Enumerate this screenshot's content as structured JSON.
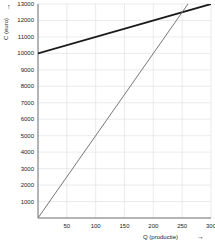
{
  "chart_data": {
    "type": "line",
    "title": "",
    "xlabel": "Q (productie)",
    "ylabel": "C (euro)",
    "xlim": [
      0,
      300
    ],
    "ylim": [
      0,
      13000
    ],
    "grid": true,
    "legend": "none",
    "x_ticks": [
      50,
      100,
      150,
      200,
      250,
      300
    ],
    "y_ticks": [
      1000,
      2000,
      3000,
      4000,
      5000,
      6000,
      7000,
      8000,
      9000,
      10000,
      11000,
      12000,
      13000
    ],
    "x_tick_labels": [
      "50",
      "100",
      "150",
      "200",
      "250",
      "300"
    ],
    "y_tick_labels": [
      "1000",
      "2000",
      "3000",
      "4000",
      "5000",
      "6000",
      "7000",
      "8000",
      "9000",
      "10000",
      "11000",
      "12000",
      "13000"
    ],
    "series": [
      {
        "name": "Totale kosten",
        "color": "#1a1a1a",
        "width": 1.8,
        "points": [
          [
            0,
            10000
          ],
          [
            300,
            13000
          ]
        ]
      },
      {
        "name": "Opbrengst",
        "color": "#777777",
        "width": 1.0,
        "points": [
          [
            0,
            0
          ],
          [
            268,
            13400
          ]
        ]
      }
    ],
    "intersection": {
      "x": 250,
      "y": 12500
    }
  },
  "axis": {
    "y_arrow_glyph": "↑",
    "x_arrow_glyph": "→"
  }
}
